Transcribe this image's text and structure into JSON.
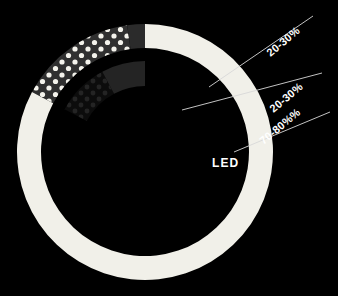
{
  "figure": {
    "background_color": "#000000",
    "led_label": "LED",
    "title": ""
  },
  "colors": {
    "background": "#000000",
    "ring_light": "#f1f0e9",
    "ring_dark_gray": "#2b2b2b",
    "dot_segment_bg": "#303030",
    "dot_segment_dots": "#f4f3ec",
    "inner_arc": "#242424",
    "inner_dot_bg": "#0c0c0c",
    "inner_dot_dots": "#242424",
    "leader_line": "#d8d8d8",
    "label_text": "#ffffff"
  },
  "chart_data": {
    "type": "pie",
    "title": "LED",
    "xlabel": "",
    "ylabel": "",
    "legend_position": "right",
    "grid": false,
    "center": {
      "x": 145,
      "y": 152
    },
    "rings": [
      {
        "name": "outer-ring",
        "outer_radius": 128,
        "inner_radius": 104,
        "segments": [
          {
            "name": "dotted-segment",
            "label": "20-30%",
            "value": 25,
            "start_angle": -62,
            "end_angle": -8,
            "fill": "#303030",
            "pattern": "polka-dots",
            "dot_color": "#f4f3ec"
          },
          {
            "name": "dark-gray-segment",
            "label": "20-30%",
            "value": 25,
            "start_angle": -8,
            "end_angle": 0,
            "fill": "#2b2b2b",
            "pattern": "solid",
            "dot_color": ""
          },
          {
            "name": "light-segment",
            "label": "70-80%",
            "value": 75,
            "start_angle": 0,
            "end_angle": 298,
            "fill": "#f1f0e9",
            "pattern": "solid",
            "dot_color": ""
          }
        ]
      },
      {
        "name": "inner-ring",
        "outer_radius": 91,
        "inner_radius": 66,
        "segments": [
          {
            "name": "inner-dotted-wedge",
            "label": "20-30%",
            "value": 25,
            "start_angle": -62,
            "end_angle": -28,
            "fill": "#0c0c0c",
            "pattern": "polka-dots",
            "dot_color": "#242424"
          },
          {
            "name": "inner-dark-arc",
            "label": "20-30%",
            "value": 25,
            "start_angle": -28,
            "end_angle": 0,
            "fill": "#242424",
            "pattern": "solid",
            "dot_color": ""
          }
        ]
      }
    ]
  },
  "callouts": [
    {
      "id": "callout-1",
      "text": "20-30%",
      "rotation_deg": -40,
      "label_x": 268,
      "label_y": 48,
      "leader": {
        "x1": 209,
        "y1": 87,
        "x2": 313,
        "y2": 16
      }
    },
    {
      "id": "callout-2",
      "text": "20-30%",
      "rotation_deg": -40,
      "label_x": 271,
      "label_y": 104,
      "leader": {
        "x1": 182,
        "y1": 110,
        "x2": 322,
        "y2": 73
      }
    },
    {
      "id": "callout-3",
      "text": "70-80%%",
      "rotation_deg": -40,
      "label_x": 261,
      "label_y": 136,
      "leader": {
        "x1": 234,
        "y1": 152,
        "x2": 330,
        "y2": 112
      }
    }
  ]
}
